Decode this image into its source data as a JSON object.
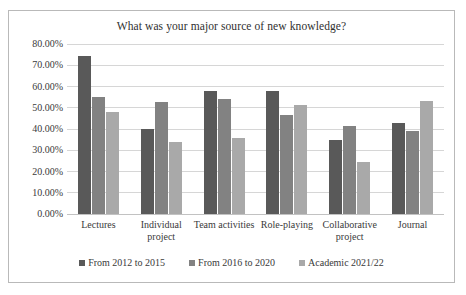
{
  "chart_data": {
    "type": "bar",
    "title": "What was your major source of new knowledge?",
    "xlabel": "",
    "ylabel": "",
    "ylim": [
      0,
      80
    ],
    "ytick_labels": [
      "80.00%",
      "70.00%",
      "60.00%",
      "50.00%",
      "40.00%",
      "30.00%",
      "20.00%",
      "10.00%",
      "0.00%"
    ],
    "ytick_values": [
      80,
      70,
      60,
      50,
      40,
      30,
      20,
      10,
      0
    ],
    "grid": "horizontal",
    "legend_position": "bottom",
    "categories": [
      "Lectures",
      "Individual project",
      "Team activities",
      "Role-playing",
      "Collaborative project",
      "Journal"
    ],
    "series": [
      {
        "name": "From 2012 to 2015",
        "color": "#595959",
        "values": [
          74.5,
          40.0,
          58.0,
          58.0,
          35.0,
          43.0
        ]
      },
      {
        "name": "From 2016 to 2020",
        "color": "#828282",
        "values": [
          55.0,
          52.5,
          54.0,
          46.5,
          41.5,
          39.0
        ]
      },
      {
        "name": "Academic 2021/22",
        "color": "#a9a9a9",
        "values": [
          48.0,
          34.0,
          36.0,
          51.5,
          24.5,
          53.0
        ]
      }
    ]
  }
}
